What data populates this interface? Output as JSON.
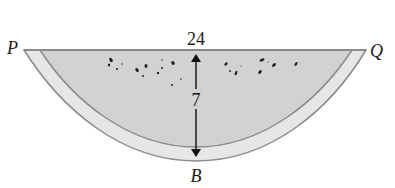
{
  "diagram": {
    "labels": {
      "left_point": "P",
      "right_point": "Q",
      "bottom_point": "B",
      "chord_length": "24",
      "depth": "7"
    },
    "colors": {
      "flesh": "#d2d2d2",
      "rind": "#e6e6e6",
      "outline": "#8a8a8a",
      "arrow": "#111111",
      "seeds": "#222222",
      "text": "#1a1a1a"
    }
  }
}
